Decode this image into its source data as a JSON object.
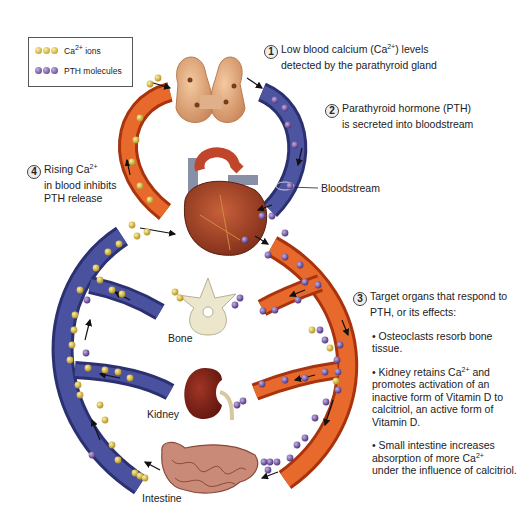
{
  "legend": {
    "ca_label_prefix": "Ca",
    "ca_label_sup": "2+",
    "ca_label_suffix": " ions",
    "pth_label": "PTH molecules",
    "ca_color": "#d8b83a",
    "pth_color": "#6a4b9a"
  },
  "colors": {
    "vein_blue": "#3d4487",
    "artery_red": "#d9521f",
    "organ_thyroid": "#e3a877",
    "organ_heart": "#a63c22",
    "organ_bone": "#e8e2c8",
    "organ_kidney": "#7a1e14",
    "organ_intestine": "#c98a78"
  },
  "steps": [
    {
      "number": "1",
      "line1_prefix": "Low blood calcium (Ca",
      "line1_sup": "2+",
      "line1_suffix": ") levels",
      "line2": "detected by the parathyroid gland"
    },
    {
      "number": "2",
      "line1": "Parathyroid hormone (PTH)",
      "line2": "is secreted into bloodstream"
    },
    {
      "number": "3",
      "line1": "Target organs that respond to",
      "line2": "PTH, or its effects:"
    },
    {
      "number": "4",
      "line1_prefix": "Rising Ca",
      "line1_sup": "2+",
      "line2": "in blood inhibits",
      "line3": "PTH release"
    }
  ],
  "effects": [
    {
      "line1": "• Osteoclasts resorb bone",
      "line2": "tissue."
    },
    {
      "line1_prefix": "• Kidney retains Ca",
      "line1_sup": "2+",
      "line1_suffix": " and",
      "line2": "promotes activation of an",
      "line3": "inactive form of Vitamin D to",
      "line4": "calcitriol, an active form of",
      "line5": "Vitamin D."
    },
    {
      "line1": "• Small intestine increases",
      "line2_prefix": "absorption of more Ca",
      "line2_sup": "2+",
      "line3": "under the influence of calcitriol."
    }
  ],
  "labels": {
    "bloodstream": "Bloodstream",
    "bone": "Bone",
    "kidney": "Kidney",
    "intestine": "Intestine"
  }
}
